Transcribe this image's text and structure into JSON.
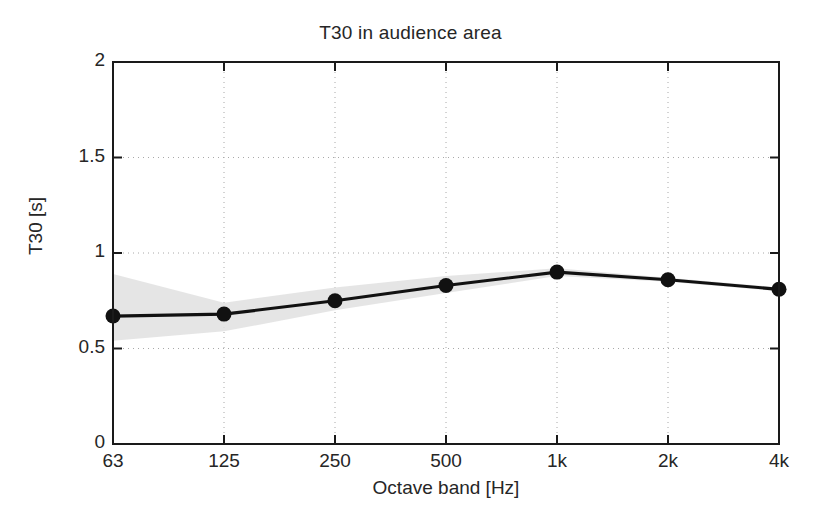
{
  "chart_data": {
    "type": "line",
    "title": "T30 in audience area",
    "xlabel": "Octave band [Hz]",
    "ylabel": "T30 [s]",
    "categories": [
      "63",
      "125",
      "250",
      "500",
      "1k",
      "2k",
      "4k"
    ],
    "xtick_labels": [
      "63",
      "125",
      "250",
      "500",
      "1k",
      "2k",
      "4k"
    ],
    "ytick_labels": [
      "0",
      "0.5",
      "1",
      "1.5",
      "2"
    ],
    "ytick_values": [
      0,
      0.5,
      1,
      1.5,
      2
    ],
    "ylim": [
      0,
      2
    ],
    "grid": "dotted",
    "legend": "none",
    "series": [
      {
        "name": "T30 mean",
        "marker": "filled-circle",
        "color": "#111111",
        "values": [
          0.67,
          0.68,
          0.75,
          0.83,
          0.9,
          0.86,
          0.81
        ]
      }
    ],
    "bands": [
      {
        "name": "T30 spread",
        "color": "#e0e0e0",
        "upper": [
          0.89,
          0.74,
          0.82,
          0.88,
          0.92,
          0.87,
          0.82
        ],
        "lower": [
          0.54,
          0.59,
          0.7,
          0.79,
          0.88,
          0.85,
          0.8
        ]
      }
    ]
  }
}
